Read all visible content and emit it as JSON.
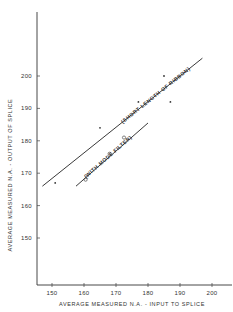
{
  "chart_data": {
    "type": "scatter",
    "title": "",
    "xlabel": "AVERAGE MEASURED N.A. - INPUT TO SPLICE",
    "ylabel": "AVERAGE MEASURED N.A. - OUTPUT OF SPLICE",
    "xlim": [
      145,
      205
    ],
    "ylim": [
      135,
      220
    ],
    "xticks": [
      150,
      160,
      170,
      180,
      190,
      200
    ],
    "yticks": [
      150,
      160,
      170,
      180,
      190,
      200
    ],
    "xtick_labels": [
      "150",
      "160",
      "170",
      "180",
      "190",
      "200"
    ],
    "ytick_labels": [
      "150",
      "160",
      "170",
      "180",
      "190",
      "200"
    ],
    "grid": false,
    "series": [
      {
        "name": "Short length of ribbon",
        "marker": "x",
        "points": [
          {
            "x": 151,
            "y": 167
          },
          {
            "x": 165,
            "y": 184
          },
          {
            "x": 177,
            "y": 192
          },
          {
            "x": 185,
            "y": 200
          },
          {
            "x": 187,
            "y": 192
          }
        ]
      },
      {
        "name": "With mode filter",
        "marker": "o",
        "points": [
          {
            "x": 160.5,
            "y": 168
          },
          {
            "x": 168,
            "y": 176
          },
          {
            "x": 172.5,
            "y": 181
          }
        ]
      }
    ],
    "fit_lines": [
      {
        "name": "short-length-fit",
        "x": [
          147,
          197
        ],
        "y": [
          166,
          205.5
        ],
        "label": "(SHORT LENGTH OF RIBBON)"
      },
      {
        "name": "mode-filter-fit",
        "x": [
          157.5,
          180
        ],
        "y": [
          166,
          185.5
        ],
        "label": "(WITH MODE FILTER)"
      }
    ]
  }
}
